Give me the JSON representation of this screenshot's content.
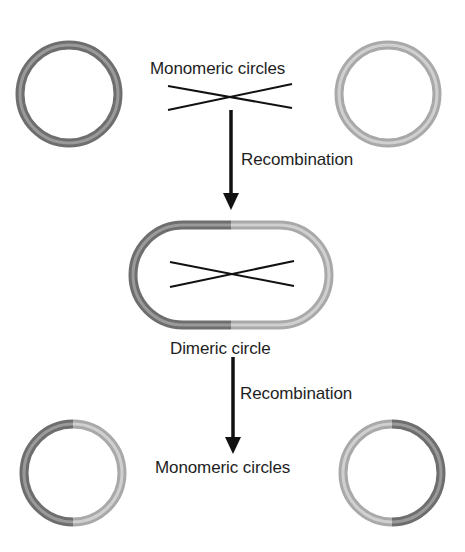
{
  "labels": {
    "top_monomers": "Monomeric circles",
    "recombination_1": "Recombination",
    "dimer": "Dimeric circle",
    "recombination_2": "Recombination",
    "bottom_monomers": "Monomeric circles"
  },
  "colors": {
    "dark_strand": "#6e6e6e",
    "dark_strand_highlight": "#9a9a9a",
    "light_strand": "#a9a9a9",
    "light_strand_highlight": "#d0d0d0",
    "line": "#111111",
    "background": "#ffffff"
  },
  "elements": {
    "top_left_circle": {
      "strand": "dark"
    },
    "top_right_circle": {
      "strand": "light"
    },
    "dimer_oval": {
      "left_half": "dark",
      "right_half": "light"
    },
    "bottom_left_circle": {
      "left_half": "dark",
      "right_half": "light"
    },
    "bottom_right_circle": {
      "left_half": "light",
      "right_half": "dark"
    }
  }
}
